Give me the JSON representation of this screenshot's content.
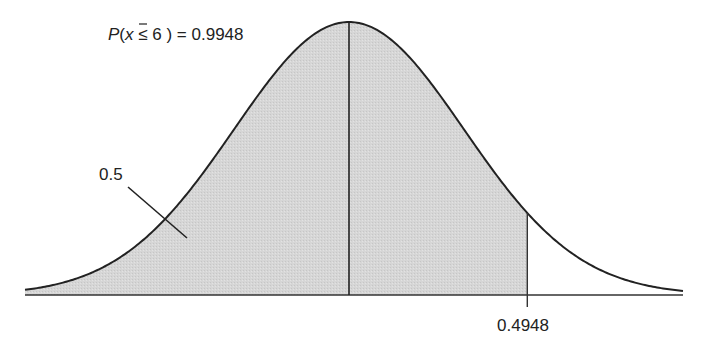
{
  "chart_data": {
    "type": "area",
    "title": "",
    "distribution": "normal",
    "mean_x_px": 349,
    "sigma_px": 115,
    "cutoff_z": 1.55,
    "annotations": {
      "probability": "P(x̄ ≤ 6 ) = 0.9948",
      "probability_value": 0.9948,
      "left_half_area": "0.5",
      "left_half_value": 0.5,
      "cutoff_area": "0.4948",
      "cutoff_area_value": 0.4948
    },
    "shaded_region": "from left tail to cutoff",
    "colors": {
      "shade": "#d4d4d4",
      "line": "#222222",
      "background": "#ffffff"
    },
    "xlabel": "",
    "ylabel": "",
    "grid": false
  }
}
